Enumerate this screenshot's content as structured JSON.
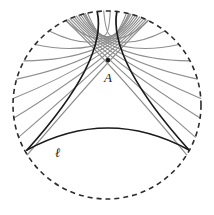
{
  "figure": {
    "domain": "Diagram",
    "canvas": {
      "width": 214,
      "height": 215,
      "background": "#ffffff"
    },
    "labels": {
      "point_a": "A",
      "line_l": "ℓ"
    },
    "label_positions": {
      "point_a": {
        "x": 104,
        "y": 82
      },
      "line_l": {
        "x": 55,
        "y": 157
      }
    },
    "colors": {
      "boundary": "#2b2b2b",
      "geodesic_dark": "#1a1a1a",
      "geodesic_gray": "#8e8e8e",
      "label": "#1a1a1a",
      "background": "#ffffff"
    },
    "boundary_circle": {
      "center_x": 107,
      "center_y": 105,
      "radius": 94,
      "style": "dashed",
      "dash_pattern": "5 4",
      "stroke_width": 1.6
    },
    "point_a": {
      "x": 108,
      "y": 60,
      "radius": 2.2
    },
    "line_l": {
      "label": "ℓ",
      "ideal_endpoint_left": {
        "x": 27,
        "y": 150
      },
      "ideal_endpoint_right": {
        "x": 189,
        "y": 150
      },
      "arc_sagitta": 22,
      "stroke_width": 1.7
    },
    "limiting_parallels": [
      {
        "name": "left-limiting-parallel",
        "from": {
          "x": 108,
          "y": 60
        },
        "to": {
          "x": 27,
          "y": 150
        },
        "bulge": 26,
        "stroke_width": 1.7
      },
      {
        "name": "right-limiting-parallel",
        "from": {
          "x": 108,
          "y": 60
        },
        "to": {
          "x": 189,
          "y": 150
        },
        "bulge": -26,
        "stroke_width": 1.7
      },
      {
        "name": "left-limiting-parallel-upper",
        "from": {
          "x": 108,
          "y": 60
        },
        "to": {
          "x": 96,
          "y": 11
        },
        "bulge": 3,
        "stroke_width": 1.7
      },
      {
        "name": "right-limiting-parallel-upper",
        "from": {
          "x": 108,
          "y": 60
        },
        "to": {
          "x": 124,
          "y": 12
        },
        "bulge": -4,
        "stroke_width": 1.7
      }
    ],
    "ultraparallel_fan": {
      "count": 22,
      "note": "Gray geodesics through A that do not meet line l",
      "left_fan_angles_deg": [
        92,
        104,
        116,
        128,
        140,
        152,
        164,
        176,
        188,
        200,
        212
      ],
      "right_fan_angles_deg": [
        88,
        76,
        64,
        52,
        40,
        28,
        16,
        4,
        -8,
        -20,
        -32
      ],
      "stroke_width": 1.1
    }
  }
}
